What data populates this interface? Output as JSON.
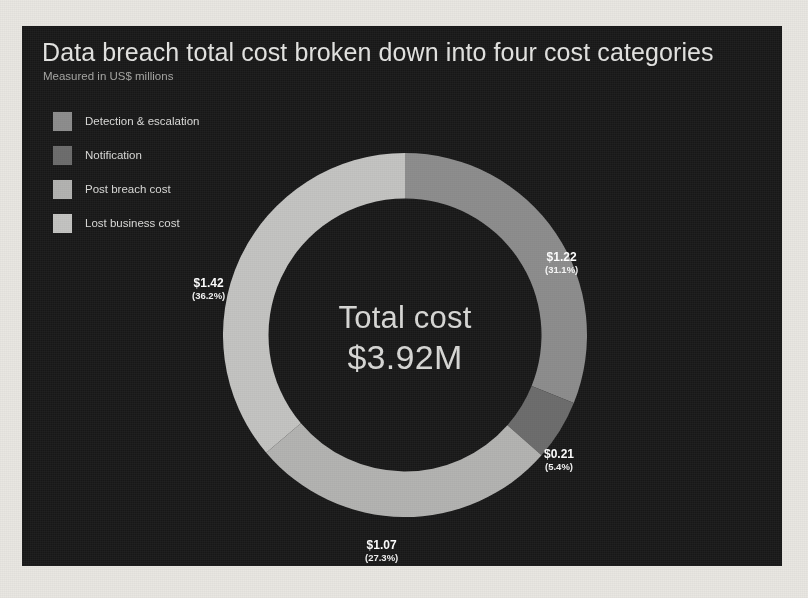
{
  "chart": {
    "title": "Data breach total cost broken down into four cost categories",
    "subtitle": "Measured in US$ millions",
    "center_title": "Total cost",
    "center_value": "$3.92M",
    "panel_bg": "#191919",
    "page_bg": "#e9e7e2"
  },
  "legend": {
    "items": [
      {
        "label": "Detection & escalation",
        "color": "#8e8e8e",
        "swatch_name": "legend-swatch-detection"
      },
      {
        "label": "Notification",
        "color": "#6e6e6e",
        "swatch_name": "legend-swatch-notification"
      },
      {
        "label": "Post breach cost",
        "color": "#b4b4b2",
        "swatch_name": "legend-swatch-post-breach"
      },
      {
        "label": "Lost business cost",
        "color": "#c4c4c2",
        "swatch_name": "legend-swatch-lost-business"
      }
    ]
  },
  "slice_labels": {
    "detection": {
      "value": "$1.22",
      "percent": "(31.1%)"
    },
    "notification": {
      "value": "$0.21",
      "percent": "(5.4%)"
    },
    "post_breach": {
      "value": "$1.07",
      "percent": "(27.3%)"
    },
    "lost_business": {
      "value": "$1.42",
      "percent": "(36.2%)"
    }
  },
  "chart_data": {
    "type": "pie",
    "variant": "donut",
    "title": "Data breach total cost broken down into four cost categories",
    "subtitle": "Measured in US$ millions",
    "units": "US$ millions",
    "total": 3.92,
    "total_label": "$3.92M",
    "center_title": "Total cost",
    "start_angle_deg": 0,
    "direction": "clockwise",
    "inner_radius_ratio": 0.75,
    "legend_position": "top-left",
    "grid": false,
    "categories": [
      "Detection & escalation",
      "Notification",
      "Post breach cost",
      "Lost business cost"
    ],
    "values": [
      1.22,
      0.21,
      1.07,
      1.42
    ],
    "percentages": [
      31.1,
      5.4,
      27.3,
      36.2
    ],
    "value_labels": [
      "$1.22",
      "$0.21",
      "$1.07",
      "$1.42"
    ],
    "percent_labels": [
      "(31.1%)",
      "(5.4%)",
      "(27.3%)",
      "(36.2%)"
    ],
    "colors": [
      "#8e8e8e",
      "#6e6e6e",
      "#b4b4b2",
      "#c4c4c2"
    ]
  }
}
